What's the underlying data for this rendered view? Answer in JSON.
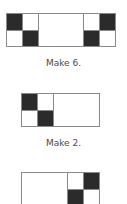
{
  "figures": [
    {
      "caption": "Make 6.",
      "layout": "left-pair + blank + right-pair",
      "left_pair": {
        "top": [
          "dark",
          "light"
        ],
        "bottom": [
          "light",
          "dark"
        ]
      },
      "right_pair": {
        "top": [
          "light",
          "dark"
        ],
        "bottom": [
          "dark",
          "light"
        ]
      }
    },
    {
      "caption": "Make 2.",
      "layout": "left-pair + blank",
      "left_pair": {
        "top": [
          "dark",
          "light"
        ],
        "bottom": [
          "light",
          "dark"
        ]
      }
    },
    {
      "caption": "",
      "layout": "blank + right-pair",
      "right_pair": {
        "top": [
          "light",
          "dark"
        ],
        "bottom": [
          "dark",
          "light"
        ]
      }
    }
  ],
  "colors": {
    "dark_cell": "#2b2b2b",
    "border": "#8a8a8a",
    "caption_text": "#4a4a4a"
  }
}
